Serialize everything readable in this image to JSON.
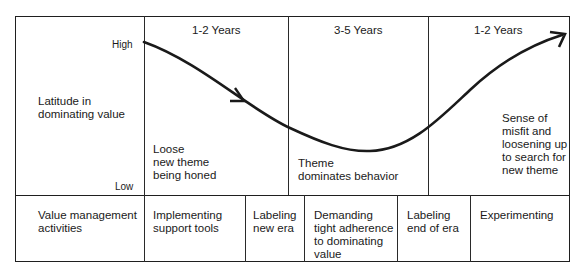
{
  "diagram": {
    "y_axis": {
      "label": "Latitude in\ndominating value",
      "high": "High",
      "low": "Low"
    },
    "periods": [
      {
        "duration": "1-2 Years",
        "description": "Loose\nnew theme\nbeing honed"
      },
      {
        "duration": "3-5 Years",
        "description": "Theme\ndominates behavior"
      },
      {
        "duration": "1-2 Years",
        "description": "Sense of\nmisfit and\nloosening up\nto search for\nnew theme"
      }
    ],
    "activities_row": {
      "label": "Value management\nactivities",
      "items": [
        "Implementing\nsupport tools",
        "Labeling\nnew era",
        "Demanding\ntight adherence\nto dominating\nvalue",
        "Labeling\nend of era",
        "Experimenting"
      ]
    },
    "curve": {
      "description": "Latitude starts high, descends to a minimum during the 3-5 year dominance period, then rises again",
      "color": "#1a1a1a"
    }
  }
}
